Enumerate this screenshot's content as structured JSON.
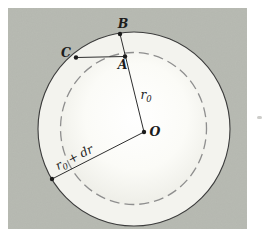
{
  "figure": {
    "colors": {
      "page_bg": "#ffffff",
      "panel_bg": "#b8bbb3",
      "annulus": "#f3f3ee",
      "disk_center": "#ffffff",
      "disk_mid": "#fbfbf7",
      "disk_edge": "#dddcd5",
      "outer_stroke": "#3c3c3c",
      "inner_dash_stroke": "#8e8e8e",
      "line": "#2e2e2e",
      "dot": "#1c1c1c",
      "text": "#1c1c1c",
      "artifact": "#c8c8c4"
    },
    "labels": {
      "point_b": "B",
      "point_c": "C",
      "point_a": "A",
      "center_o": "O",
      "radius_r0_base": "r",
      "radius_r0_sub": "0",
      "radius_dr_base": "r",
      "radius_dr_sub": "0",
      "radius_dr_plus": "+",
      "radius_dr_rest": "dr"
    }
  }
}
